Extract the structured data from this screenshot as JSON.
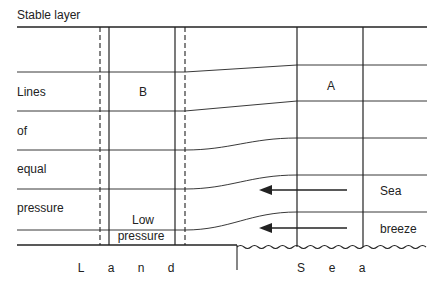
{
  "title": "Stable layer",
  "left_labels": [
    "Lines",
    "of",
    "equal",
    "pressure"
  ],
  "regions": {
    "land_column_label": "B",
    "sea_column_label": "A",
    "low_pressure_line1": "Low",
    "low_pressure_line2": "pressure"
  },
  "wind_labels": [
    "Sea",
    "breeze"
  ],
  "ground_labels": {
    "land": [
      "L",
      "a",
      "n",
      "d"
    ],
    "sea": [
      "S",
      "e",
      "a"
    ]
  },
  "colors": {
    "line": "#222222",
    "background": "#ffffff"
  }
}
